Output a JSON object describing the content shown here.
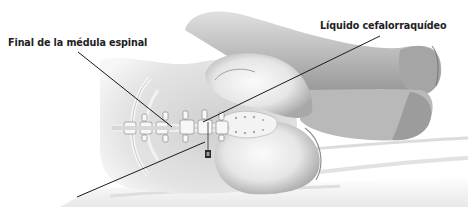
{
  "figure": {
    "labels": [
      {
        "id": "spinal-cord-end",
        "text": "Final de la médula espinal",
        "anchor": [
          78,
          52
        ],
        "target": [
          172,
          127
        ]
      },
      {
        "id": "csf",
        "text": "Líquido cefalorraquídeo",
        "anchor": [
          380,
          36
        ],
        "target": [
          203,
          122
        ]
      }
    ],
    "needle_line": {
      "from": [
        77,
        197
      ],
      "to": [
        205,
        142
      ]
    },
    "colors": {
      "background": "#ffffff",
      "skin_light": "#f2f2f2",
      "skin_mid": "#d0d0d0",
      "skin_shadow": "#9a9a9a",
      "bone": "#f4f4f4",
      "leader_line": "#1a1a1a",
      "text": "#222222"
    }
  }
}
